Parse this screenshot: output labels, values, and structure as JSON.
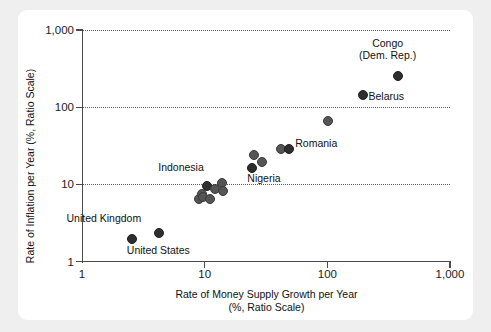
{
  "chart_data": {
    "type": "scatter",
    "title": "",
    "xlabel": "Rate of Money Supply Growth per Year",
    "xlabel_line2": "(%, Ratio Scale)",
    "ylabel": "Rate of Inflation per Year (%, Ratio Scale)",
    "xscale": "log",
    "yscale": "log",
    "xlim": [
      1,
      1000
    ],
    "ylim": [
      1,
      1000
    ],
    "xticks": [
      "1",
      "10",
      "100",
      "1,000"
    ],
    "xtick_values": [
      1,
      10,
      100,
      1000
    ],
    "yticks": [
      "1",
      "10",
      "100",
      "1,000"
    ],
    "ytick_values": [
      1,
      10,
      100,
      1000
    ],
    "grid": "horizontal dotted gridlines at 10, 100, 1,000",
    "legend": "none",
    "points": [
      {
        "label": "United States",
        "x": 2.5,
        "y": 2.0,
        "label_dx": -4,
        "label_dy": 12,
        "label_anchor": "start"
      },
      {
        "label": "United Kingdom",
        "x": 4.2,
        "y": 2.4,
        "label_dx": -92,
        "label_dy": -14,
        "label_anchor": "start"
      },
      {
        "label": "",
        "x": 8.8,
        "y": 6.6,
        "label_dx": 0,
        "label_dy": 0,
        "label_anchor": "start"
      },
      {
        "label": "",
        "x": 9.3,
        "y": 7.7,
        "label_dx": 0,
        "label_dy": 0,
        "label_anchor": "start"
      },
      {
        "label": "",
        "x": 9.6,
        "y": 7.0,
        "label_dx": 0,
        "label_dy": 0,
        "label_anchor": "start"
      },
      {
        "label": "Indonesia",
        "x": 10.3,
        "y": 9.7,
        "label_dx": -48,
        "label_dy": -18,
        "label_anchor": "start"
      },
      {
        "label": "",
        "x": 10.8,
        "y": 6.6,
        "label_dx": 0,
        "label_dy": 0,
        "label_anchor": "start"
      },
      {
        "label": "",
        "x": 12.0,
        "y": 8.9,
        "label_dx": 0,
        "label_dy": 0,
        "label_anchor": "start"
      },
      {
        "label": "",
        "x": 13.5,
        "y": 10.8,
        "label_dx": 0,
        "label_dy": 0,
        "label_anchor": "start"
      },
      {
        "label": "",
        "x": 13.8,
        "y": 8.4,
        "label_dx": 0,
        "label_dy": 0,
        "label_anchor": "start"
      },
      {
        "label": "Nigeria",
        "x": 24.0,
        "y": 17.0,
        "label_dx": -4,
        "label_dy": 11,
        "label_anchor": "start"
      },
      {
        "label": "",
        "x": 25.0,
        "y": 25.0,
        "label_dx": 0,
        "label_dy": 0,
        "label_anchor": "start"
      },
      {
        "label": "",
        "x": 29.0,
        "y": 20.0,
        "label_dx": 0,
        "label_dy": 0,
        "label_anchor": "start"
      },
      {
        "label": "",
        "x": 41.0,
        "y": 30.0,
        "label_dx": 0,
        "label_dy": 0,
        "label_anchor": "start"
      },
      {
        "label": "Romania",
        "x": 48.0,
        "y": 30.0,
        "label_dx": 7,
        "label_dy": -5,
        "label_anchor": "start"
      },
      {
        "label": "",
        "x": 100.0,
        "y": 68.0,
        "label_dx": 0,
        "label_dy": 0,
        "label_anchor": "start"
      },
      {
        "label": "Belarus",
        "x": 190.0,
        "y": 150.0,
        "label_dx": 7,
        "label_dy": 2,
        "label_anchor": "start"
      },
      {
        "label": "Congo\n(Dem. Rep.)",
        "x": 370.0,
        "y": 260.0,
        "label_dx": -38,
        "label_dy": -32,
        "label_anchor": "start"
      }
    ]
  }
}
